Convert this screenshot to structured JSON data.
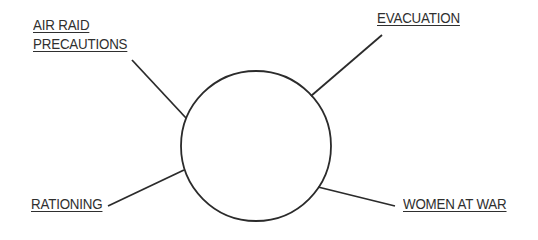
{
  "diagram": {
    "type": "spider-diagram",
    "center": {
      "label": "",
      "cx": 256,
      "cy": 146,
      "r": 75
    },
    "stroke_color": "#2b2b2b",
    "text_color": "#2f2f2f",
    "branches": [
      {
        "id": "air-raid-precautions",
        "lines": [
          "AIR RAID",
          "PRECAUTIONS"
        ],
        "line": [
          132,
          60,
          186,
          118
        ]
      },
      {
        "id": "evacuation",
        "lines": [
          "EVACUATION"
        ],
        "line": [
          382,
          35,
          311,
          96
        ]
      },
      {
        "id": "rationing",
        "lines": [
          "RATIONING"
        ],
        "line": [
          108,
          206,
          184,
          170
        ]
      },
      {
        "id": "women-at-war",
        "lines": [
          "WOMEN AT WAR"
        ],
        "line": [
          318,
          187,
          395,
          206
        ]
      }
    ]
  }
}
